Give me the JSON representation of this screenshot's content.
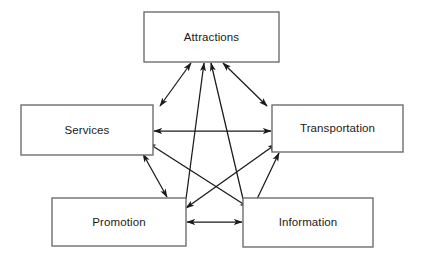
{
  "diagram": {
    "type": "node-link-diagram",
    "title": "",
    "background_color": "#ffffff",
    "node_border_color": "#6e6e6e",
    "edge_color": "#1a1a1a",
    "label_color": "#1a1a1a",
    "nodes": [
      {
        "id": "attractions",
        "label": "Attractions",
        "x": 144,
        "y": 12,
        "w": 135,
        "h": 50,
        "cx": 211.5,
        "cy": 37
      },
      {
        "id": "services",
        "label": "Services",
        "x": 21,
        "y": 105,
        "w": 132,
        "h": 50,
        "cx": 87,
        "cy": 130
      },
      {
        "id": "transportation",
        "label": "Transportation",
        "x": 272,
        "y": 105,
        "w": 131,
        "h": 47,
        "cx": 337.5,
        "cy": 128
      },
      {
        "id": "promotion",
        "label": "Promotion",
        "x": 52,
        "y": 198,
        "w": 134,
        "h": 48,
        "cx": 119,
        "cy": 222
      },
      {
        "id": "information",
        "label": "Information",
        "x": 243,
        "y": 198,
        "w": 130,
        "h": 49,
        "cx": 308,
        "cy": 222
      }
    ],
    "edges": [
      {
        "id": "services-attractions",
        "from": "services",
        "to": "attractions",
        "arrows": "both",
        "x1": 160,
        "y1": 106,
        "x2": 191,
        "y2": 63
      },
      {
        "id": "promotion-attractions",
        "from": "promotion",
        "to": "attractions",
        "arrows": "end",
        "x1": 186,
        "y1": 199,
        "x2": 204,
        "y2": 63
      },
      {
        "id": "information-attractions",
        "from": "information",
        "to": "attractions",
        "arrows": "end",
        "x1": 243,
        "y1": 199,
        "x2": 211,
        "y2": 63
      },
      {
        "id": "transportation-attractions",
        "from": "transportation",
        "to": "attractions",
        "arrows": "both",
        "x1": 267,
        "y1": 106,
        "x2": 223,
        "y2": 63
      },
      {
        "id": "services-transportation",
        "from": "services",
        "to": "transportation",
        "arrows": "both",
        "x1": 154,
        "y1": 131,
        "x2": 271,
        "y2": 131
      },
      {
        "id": "promotion-information",
        "from": "promotion",
        "to": "information",
        "arrows": "both",
        "x1": 187,
        "y1": 222,
        "x2": 242,
        "y2": 222
      },
      {
        "id": "services-promotion",
        "from": "services",
        "to": "promotion",
        "arrows": "both",
        "x1": 143,
        "y1": 154,
        "x2": 167,
        "y2": 197
      },
      {
        "id": "services-information",
        "from": "services",
        "to": "information",
        "arrows": "both",
        "x1": 148,
        "y1": 143,
        "x2": 248,
        "y2": 207
      },
      {
        "id": "promotion-transportation",
        "from": "promotion",
        "to": "transportation",
        "arrows": "both",
        "x1": 186,
        "y1": 208,
        "x2": 276,
        "y2": 144
      },
      {
        "id": "information-transportation",
        "from": "information",
        "to": "transportation",
        "arrows": "end",
        "x1": 257,
        "y1": 199,
        "x2": 279,
        "y2": 153
      }
    ]
  }
}
